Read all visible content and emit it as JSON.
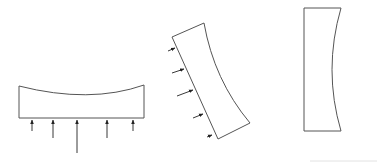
{
  "diagram": {
    "stroke_color": "#555555",
    "arrow_color": "#222222",
    "shapes": [
      {
        "name": "horizontal-beam",
        "path": "M19,86 Q90,104 144,85 L144,118 L19,118 Z",
        "arrows": [
          {
            "x1": 32,
            "y1": 131,
            "x2": 32,
            "y2": 120
          },
          {
            "x1": 53,
            "y1": 138,
            "x2": 53,
            "y2": 120
          },
          {
            "x1": 77,
            "y1": 153,
            "x2": 77,
            "y2": 120
          },
          {
            "x1": 107,
            "y1": 138,
            "x2": 107,
            "y2": 120
          },
          {
            "x1": 133,
            "y1": 131,
            "x2": 133,
            "y2": 120
          }
        ]
      },
      {
        "name": "tilted-beam",
        "path": "M172,37 L204,23 Q214,80 250,123 L218,139 Z",
        "arrows": [
          {
            "x1": 168,
            "y1": 51,
            "x2": 175,
            "y2": 48
          },
          {
            "x1": 172,
            "y1": 73,
            "x2": 184,
            "y2": 69
          },
          {
            "x1": 177,
            "y1": 96,
            "x2": 193,
            "y2": 90
          },
          {
            "x1": 193,
            "y1": 118,
            "x2": 203,
            "y2": 114
          },
          {
            "x1": 207,
            "y1": 137,
            "x2": 212,
            "y2": 135
          }
        ]
      },
      {
        "name": "vertical-beam",
        "path": "M304,8 L341,8 Q323,70 341,131 L304,131 Z",
        "arrows": []
      }
    ],
    "baseline": {
      "x1": 310,
      "y1": 161,
      "x2": 377,
      "y2": 161,
      "color": "#e2e2e2"
    }
  }
}
